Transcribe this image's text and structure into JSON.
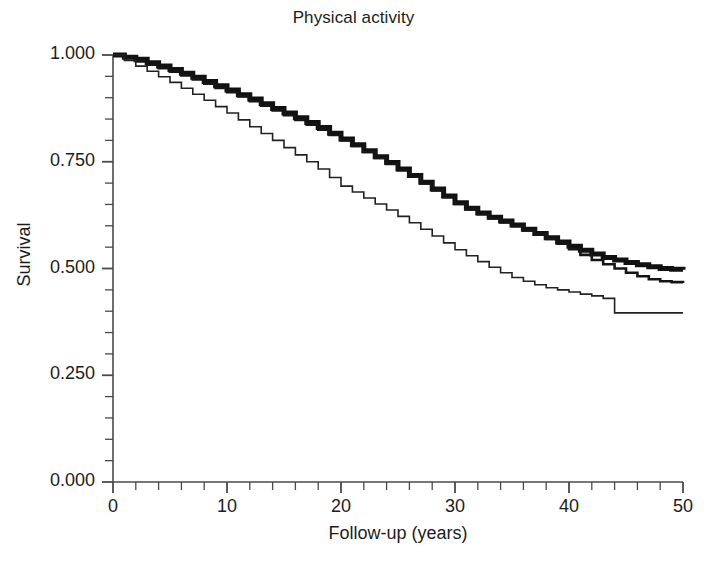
{
  "chart_data": {
    "type": "line",
    "title": "Physical activity",
    "xlabel": "Follow-up (years)",
    "ylabel": "Survival",
    "xlim": [
      0,
      50
    ],
    "ylim": [
      0,
      1
    ],
    "grid": false,
    "legend": "none",
    "xticks": [
      0,
      10,
      20,
      30,
      40,
      50
    ],
    "xtick_labels": [
      "0",
      "10",
      "20",
      "30",
      "40",
      "50"
    ],
    "x_minor_tick_step": 2,
    "yticks": [
      0.0,
      0.25,
      0.5,
      0.75,
      1.0
    ],
    "ytick_labels": [
      "0.000",
      "0.250",
      "0.500",
      "0.750",
      "1.000"
    ],
    "y_minor_tick_step": 0.05,
    "step_type": "post",
    "series": [
      {
        "name": "curve-thick",
        "style": "step",
        "linewidth": 5,
        "color": "#111111",
        "x": [
          0,
          1,
          2,
          3,
          4,
          5,
          6,
          7,
          8,
          9,
          10,
          11,
          12,
          13,
          14,
          15,
          16,
          17,
          18,
          19,
          20,
          21,
          22,
          23,
          24,
          25,
          26,
          27,
          28,
          29,
          30,
          31,
          32,
          33,
          34,
          35,
          36,
          37,
          38,
          39,
          40,
          41,
          42,
          43,
          44,
          45,
          46,
          47,
          48,
          49,
          50
        ],
        "y": [
          1.0,
          0.995,
          0.99,
          0.982,
          0.974,
          0.966,
          0.957,
          0.948,
          0.938,
          0.928,
          0.918,
          0.907,
          0.897,
          0.886,
          0.875,
          0.864,
          0.853,
          0.842,
          0.83,
          0.817,
          0.803,
          0.79,
          0.776,
          0.762,
          0.748,
          0.733,
          0.718,
          0.702,
          0.686,
          0.67,
          0.654,
          0.641,
          0.63,
          0.62,
          0.611,
          0.602,
          0.592,
          0.582,
          0.572,
          0.562,
          0.552,
          0.543,
          0.534,
          0.526,
          0.52,
          0.514,
          0.509,
          0.504,
          0.5,
          0.498,
          0.497
        ]
      },
      {
        "name": "curve-medium",
        "style": "step",
        "linewidth": 2.6,
        "color": "#151515",
        "x": [
          0,
          1,
          2,
          3,
          4,
          5,
          6,
          7,
          8,
          9,
          10,
          11,
          12,
          13,
          14,
          15,
          16,
          17,
          18,
          19,
          20,
          21,
          22,
          23,
          24,
          25,
          26,
          27,
          28,
          29,
          30,
          31,
          32,
          33,
          34,
          35,
          36,
          37,
          38,
          39,
          40,
          41,
          42,
          43,
          44,
          45,
          46,
          47,
          48,
          49,
          50
        ],
        "y": [
          1.0,
          0.993,
          0.985,
          0.977,
          0.969,
          0.961,
          0.952,
          0.943,
          0.933,
          0.923,
          0.913,
          0.903,
          0.892,
          0.881,
          0.87,
          0.859,
          0.848,
          0.837,
          0.825,
          0.813,
          0.8,
          0.787,
          0.773,
          0.759,
          0.745,
          0.73,
          0.715,
          0.699,
          0.683,
          0.667,
          0.651,
          0.638,
          0.627,
          0.617,
          0.608,
          0.599,
          0.589,
          0.579,
          0.569,
          0.558,
          0.545,
          0.532,
          0.52,
          0.51,
          0.5,
          0.49,
          0.482,
          0.475,
          0.47,
          0.468,
          0.466
        ]
      },
      {
        "name": "curve-thin",
        "style": "step",
        "linewidth": 1.6,
        "color": "#222222",
        "x": [
          0,
          1,
          2,
          3,
          4,
          5,
          6,
          7,
          8,
          9,
          10,
          11,
          12,
          13,
          14,
          15,
          16,
          17,
          18,
          19,
          20,
          21,
          22,
          23,
          24,
          25,
          26,
          27,
          28,
          29,
          30,
          31,
          32,
          33,
          34,
          35,
          36,
          37,
          38,
          39,
          40,
          41,
          42,
          43,
          44,
          45,
          46,
          47,
          48,
          49,
          50
        ],
        "y": [
          1.0,
          0.987,
          0.974,
          0.962,
          0.949,
          0.936,
          0.922,
          0.908,
          0.894,
          0.879,
          0.864,
          0.848,
          0.832,
          0.816,
          0.8,
          0.783,
          0.766,
          0.75,
          0.733,
          0.713,
          0.693,
          0.679,
          0.665,
          0.651,
          0.637,
          0.622,
          0.607,
          0.592,
          0.576,
          0.56,
          0.544,
          0.53,
          0.516,
          0.503,
          0.49,
          0.479,
          0.47,
          0.462,
          0.455,
          0.45,
          0.445,
          0.44,
          0.436,
          0.43,
          0.396,
          0.396,
          0.396,
          0.396,
          0.396,
          0.396,
          0.396
        ]
      }
    ]
  }
}
